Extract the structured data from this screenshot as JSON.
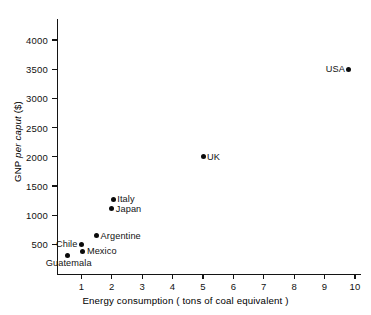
{
  "chart_data": {
    "type": "scatter",
    "title": "",
    "xlabel": "Energy consumption ( tons of coal equivalent )",
    "ylabel": "GNP per caput ($)",
    "ylabel_parts": {
      "prefix": "GNP ",
      "italic": "per caput",
      "suffix": " ($)"
    },
    "xlim": [
      0,
      10
    ],
    "ylim": [
      0,
      4000
    ],
    "xticks": [
      1,
      2,
      3,
      4,
      5,
      6,
      7,
      8,
      9,
      10
    ],
    "xtick_labels": [
      "1",
      "2",
      "3",
      "4",
      "5",
      "6",
      "7",
      "8",
      "9",
      "10"
    ],
    "yticks": [
      500,
      1000,
      1500,
      2000,
      2500,
      3000,
      3500,
      4000
    ],
    "ytick_labels": [
      "500",
      "1000",
      "1500",
      "2000",
      "2500",
      "3000",
      "3500",
      "4000"
    ],
    "grid": false,
    "legend": "none",
    "marker_color": "#0b0b0b",
    "axis_color": "#141414",
    "points": [
      {
        "label": "USA",
        "x": 9.8,
        "y": 3500,
        "label_side": "left"
      },
      {
        "label": "UK",
        "x": 5.0,
        "y": 2000,
        "label_side": "right"
      },
      {
        "label": "Italy",
        "x": 2.05,
        "y": 1270,
        "label_side": "right"
      },
      {
        "label": "Japan",
        "x": 2.0,
        "y": 1110,
        "label_side": "right"
      },
      {
        "label": "Argentine",
        "x": 1.5,
        "y": 650,
        "label_side": "right"
      },
      {
        "label": "Chile",
        "x": 1.0,
        "y": 500,
        "label_side": "left"
      },
      {
        "label": "Mexico",
        "x": 1.05,
        "y": 380,
        "label_side": "right"
      },
      {
        "label": "Guatemala",
        "x": 0.55,
        "y": 310,
        "label_side": "below"
      }
    ]
  }
}
